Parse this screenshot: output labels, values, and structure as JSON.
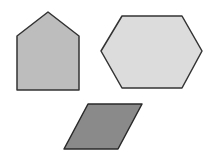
{
  "canvas": {
    "width": 214,
    "height": 158,
    "background": "#ffffff"
  },
  "shapes": [
    {
      "name": "pentagon",
      "points": "48,12 79,36 79,90 17,90 17,36",
      "fill": "#bdbdbd",
      "stroke": "#333333"
    },
    {
      "name": "hexagon",
      "points": "122,16 182,16 202,51 182,88 122,88 101,51",
      "fill": "#dcdcdc",
      "stroke": "#333333"
    },
    {
      "name": "parallelogram",
      "points": "88,104 142,104 118,149 64,149",
      "fill": "#8a8a8a",
      "stroke": "#2a2a2a"
    }
  ]
}
